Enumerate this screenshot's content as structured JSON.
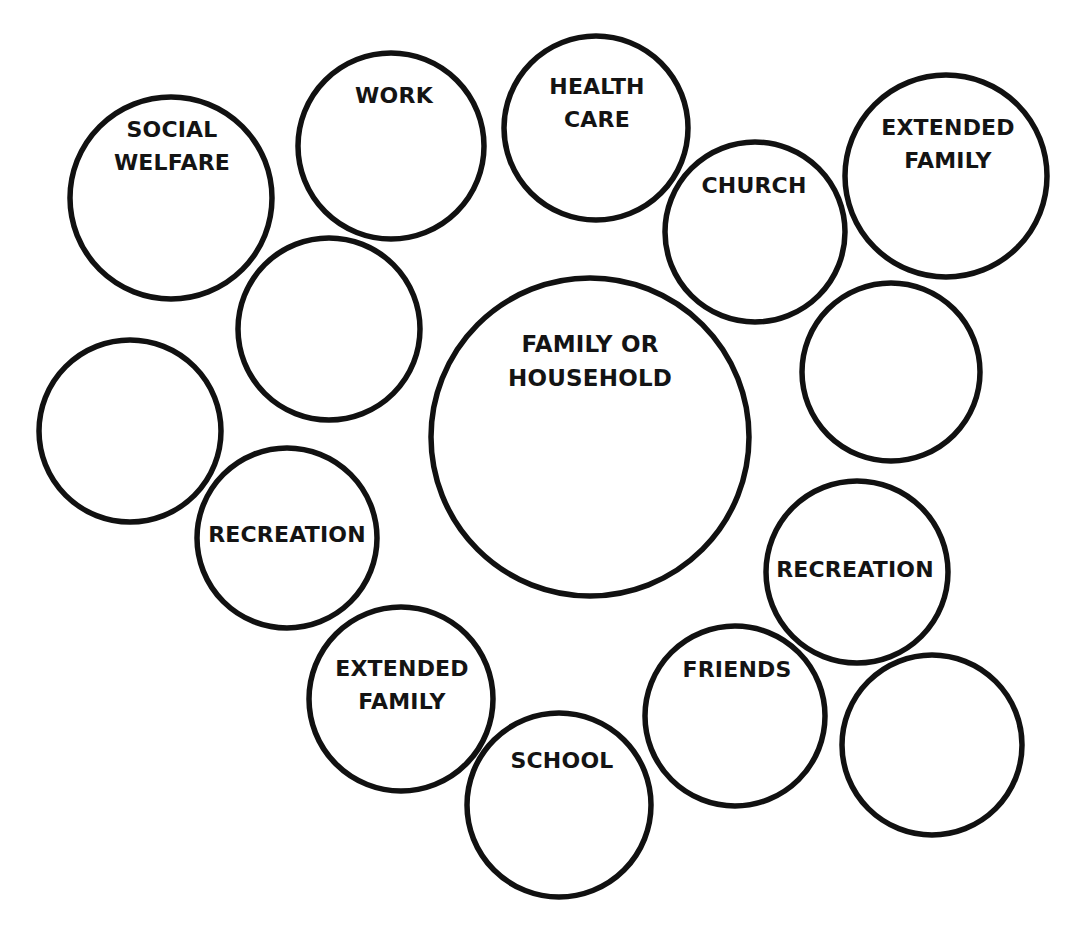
{
  "diagram": {
    "type": "ecomap",
    "colors": {
      "background": "#ffffff",
      "stroke": "#111111",
      "text": "#141414"
    },
    "center_node": {
      "id": "family-or-household",
      "label_lines": [
        "FAMILY OR",
        "HOUSEHOLD"
      ],
      "cx": 590,
      "cy": 437,
      "r": 159,
      "label_x": 590,
      "label_y": 327
    },
    "nodes": [
      {
        "id": "social-welfare",
        "label_lines": [
          "SOCIAL",
          "WELFARE"
        ],
        "cx": 171,
        "cy": 198,
        "r": 101,
        "label_x": 172,
        "label_y": 113
      },
      {
        "id": "work",
        "label_lines": [
          "WORK"
        ],
        "cx": 391,
        "cy": 146,
        "r": 93,
        "label_x": 394,
        "label_y": 79
      },
      {
        "id": "health-care",
        "label_lines": [
          "HEALTH",
          "CARE"
        ],
        "cx": 596,
        "cy": 128,
        "r": 92,
        "label_x": 597,
        "label_y": 70
      },
      {
        "id": "church",
        "label_lines": [
          "CHURCH"
        ],
        "cx": 755,
        "cy": 232,
        "r": 90,
        "label_x": 754,
        "label_y": 169
      },
      {
        "id": "extended-family-top",
        "label_lines": [
          "EXTENDED",
          "FAMILY"
        ],
        "cx": 946,
        "cy": 176,
        "r": 101,
        "label_x": 948,
        "label_y": 111
      },
      {
        "id": "blank-upper-left",
        "label_lines": [],
        "cx": 329,
        "cy": 329,
        "r": 91,
        "label_x": 329,
        "label_y": 329
      },
      {
        "id": "blank-right",
        "label_lines": [],
        "cx": 891,
        "cy": 372,
        "r": 89,
        "label_x": 891,
        "label_y": 372
      },
      {
        "id": "blank-left",
        "label_lines": [],
        "cx": 130,
        "cy": 431,
        "r": 91,
        "label_x": 130,
        "label_y": 431
      },
      {
        "id": "recreation-left",
        "label_lines": [
          "RECREATION"
        ],
        "cx": 287,
        "cy": 538,
        "r": 90,
        "label_x": 287,
        "label_y": 518
      },
      {
        "id": "recreation-right",
        "label_lines": [
          "RECREATION"
        ],
        "cx": 857,
        "cy": 572,
        "r": 91,
        "label_x": 855,
        "label_y": 553
      },
      {
        "id": "extended-family-bottom",
        "label_lines": [
          "EXTENDED",
          "FAMILY"
        ],
        "cx": 401,
        "cy": 699,
        "r": 92,
        "label_x": 402,
        "label_y": 652
      },
      {
        "id": "friends",
        "label_lines": [
          "FRIENDS"
        ],
        "cx": 735,
        "cy": 716,
        "r": 90,
        "label_x": 737,
        "label_y": 653
      },
      {
        "id": "school",
        "label_lines": [
          "SCHOOL"
        ],
        "cx": 559,
        "cy": 805,
        "r": 92,
        "label_x": 562,
        "label_y": 744
      },
      {
        "id": "blank-bottom-right",
        "label_lines": [],
        "cx": 932,
        "cy": 745,
        "r": 90,
        "label_x": 932,
        "label_y": 745
      }
    ]
  }
}
